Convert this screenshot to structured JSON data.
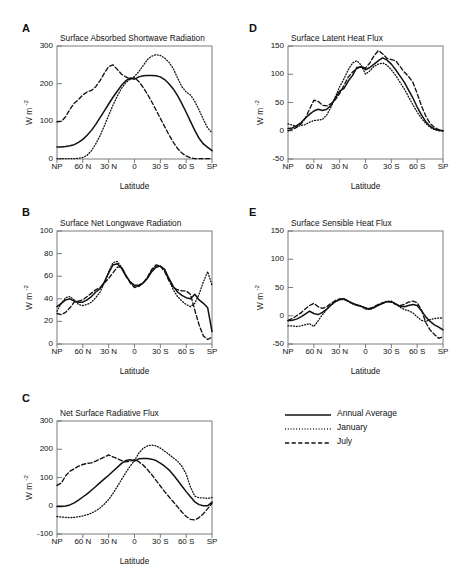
{
  "figure": {
    "width": 472,
    "height": 577,
    "background": "#ffffff",
    "line_color": "#111111"
  },
  "legend": {
    "entries": [
      {
        "label": "Annual Average",
        "style": "solid"
      },
      {
        "label": "January",
        "style": "dotted"
      },
      {
        "label": "July",
        "style": "dashed"
      }
    ]
  },
  "axis_common": {
    "xlabel": "Latitude",
    "ylabel": "W m",
    "ylabel_exponent": "-2",
    "xticks": [
      "NP",
      "60 N",
      "30 N",
      "0",
      "30 S",
      "60 S",
      "SP"
    ],
    "xlim": [
      90,
      -90
    ]
  },
  "chart_data": [
    {
      "panel": "A",
      "type": "line",
      "title": "Surface Absorbed Shortwave Radiation",
      "xlabel": "Latitude",
      "ylabel": "W m-2",
      "xticks": [
        "NP",
        "60 N",
        "30 N",
        "0",
        "30 S",
        "60 S",
        "SP"
      ],
      "xtickvals": [
        90,
        60,
        30,
        0,
        -30,
        -60,
        -90
      ],
      "yticks": [
        0,
        100,
        200,
        300
      ],
      "ylim": [
        0,
        300
      ],
      "xlim": [
        90,
        -90
      ],
      "x": [
        90,
        85,
        80,
        75,
        70,
        65,
        60,
        55,
        50,
        45,
        40,
        35,
        30,
        25,
        20,
        15,
        10,
        5,
        0,
        -5,
        -10,
        -15,
        -20,
        -25,
        -30,
        -35,
        -40,
        -45,
        -50,
        -55,
        -60,
        -65,
        -70,
        -75,
        -80,
        -85,
        -90
      ],
      "series": [
        {
          "name": "Annual Average",
          "style": "solid",
          "values": [
            32,
            32,
            33,
            35,
            38,
            44,
            52,
            63,
            76,
            92,
            110,
            128,
            146,
            164,
            180,
            196,
            208,
            215,
            212,
            218,
            221,
            222,
            222,
            221,
            218,
            211,
            200,
            186,
            168,
            147,
            124,
            100,
            76,
            55,
            40,
            31,
            22
          ]
        },
        {
          "name": "January",
          "style": "dotted",
          "values": [
            1,
            1,
            1,
            1,
            1,
            2,
            4,
            10,
            22,
            40,
            62,
            88,
            116,
            143,
            167,
            188,
            203,
            212,
            219,
            232,
            248,
            264,
            273,
            277,
            275,
            268,
            257,
            240,
            215,
            192,
            178,
            170,
            153,
            130,
            105,
            82,
            70
          ]
        },
        {
          "name": "July",
          "style": "dashed",
          "values": [
            99,
            100,
            112,
            132,
            148,
            158,
            170,
            178,
            182,
            192,
            208,
            228,
            245,
            250,
            238,
            225,
            218,
            212,
            216,
            206,
            190,
            172,
            152,
            130,
            108,
            86,
            64,
            45,
            28,
            16,
            8,
            3,
            1,
            1,
            1,
            1,
            1
          ]
        }
      ]
    },
    {
      "panel": "B",
      "type": "line",
      "title": "Surface Net Longwave Radiation",
      "xlabel": "Latitude",
      "ylabel": "W m-2",
      "xticks": [
        "NP",
        "60 N",
        "30 N",
        "0",
        "30 S",
        "60 S",
        "SP"
      ],
      "xtickvals": [
        90,
        60,
        30,
        0,
        -30,
        -60,
        -90
      ],
      "yticks": [
        0,
        20,
        40,
        60,
        80,
        100
      ],
      "ylim": [
        0,
        100
      ],
      "xlim": [
        90,
        -90
      ],
      "x": [
        90,
        85,
        80,
        75,
        70,
        65,
        60,
        55,
        50,
        45,
        40,
        35,
        30,
        25,
        20,
        15,
        10,
        5,
        0,
        -5,
        -10,
        -15,
        -20,
        -25,
        -30,
        -35,
        -40,
        -45,
        -50,
        -55,
        -60,
        -65,
        -70,
        -75,
        -80,
        -85,
        -90
      ],
      "series": [
        {
          "name": "Annual Average",
          "style": "solid",
          "values": [
            33,
            36,
            39,
            40,
            38,
            37,
            37,
            39,
            42,
            46,
            49,
            55,
            63,
            70,
            71,
            67,
            60,
            55,
            52,
            52,
            54,
            58,
            64,
            68,
            69,
            66,
            58,
            51,
            46,
            43,
            41,
            40,
            44,
            39,
            36,
            32,
            11
          ]
        },
        {
          "name": "January",
          "style": "dotted",
          "values": [
            29,
            36,
            41,
            42,
            39,
            35,
            34,
            35,
            37,
            41,
            46,
            54,
            64,
            72,
            73,
            68,
            61,
            55,
            51,
            51,
            54,
            59,
            65,
            69,
            69,
            65,
            57,
            48,
            42,
            38,
            35,
            33,
            36,
            44,
            55,
            64,
            52
          ]
        },
        {
          "name": "July",
          "style": "dashed",
          "values": [
            27,
            26,
            28,
            32,
            37,
            38,
            39,
            42,
            45,
            48,
            50,
            54,
            58,
            63,
            68,
            68,
            61,
            54,
            50,
            51,
            54,
            59,
            66,
            70,
            69,
            64,
            56,
            50,
            48,
            47,
            47,
            44,
            30,
            17,
            7,
            4,
            6
          ]
        }
      ]
    },
    {
      "panel": "C",
      "type": "line",
      "title": "Net Surface Radiative Flux",
      "xlabel": "Latitude",
      "ylabel": "W m-2",
      "xticks": [
        "NP",
        "60 N",
        "30 N",
        "0",
        "30 S",
        "60 S",
        "SP"
      ],
      "xtickvals": [
        90,
        60,
        30,
        0,
        -30,
        -60,
        -90
      ],
      "yticks": [
        -100,
        0,
        100,
        200,
        300
      ],
      "ylim": [
        -100,
        300
      ],
      "xlim": [
        90,
        -90
      ],
      "x": [
        90,
        85,
        80,
        75,
        70,
        65,
        60,
        55,
        50,
        45,
        40,
        35,
        30,
        25,
        20,
        15,
        10,
        5,
        0,
        -5,
        -10,
        -15,
        -20,
        -25,
        -30,
        -35,
        -40,
        -45,
        -50,
        -55,
        -60,
        -65,
        -70,
        -75,
        -80,
        -85,
        -90
      ],
      "series": [
        {
          "name": "Annual Average",
          "style": "solid",
          "values": [
            -3,
            -3,
            -1,
            3,
            10,
            20,
            31,
            42,
            55,
            68,
            82,
            95,
            108,
            122,
            136,
            150,
            160,
            163,
            158,
            166,
            167,
            167,
            165,
            160,
            151,
            140,
            127,
            110,
            90,
            70,
            50,
            32,
            14,
            4,
            0,
            0,
            13
          ]
        },
        {
          "name": "January",
          "style": "dotted",
          "values": [
            -38,
            -40,
            -41,
            -42,
            -41,
            -39,
            -36,
            -32,
            -26,
            -18,
            -8,
            6,
            22,
            43,
            68,
            93,
            118,
            140,
            160,
            186,
            203,
            212,
            215,
            212,
            204,
            193,
            182,
            170,
            158,
            140,
            112,
            66,
            34,
            28,
            28,
            26,
            29
          ]
        },
        {
          "name": "July",
          "style": "dashed",
          "values": [
            72,
            80,
            106,
            122,
            131,
            140,
            146,
            150,
            152,
            158,
            165,
            172,
            180,
            173,
            167,
            160,
            155,
            158,
            163,
            156,
            144,
            128,
            110,
            90,
            70,
            50,
            32,
            14,
            -4,
            -22,
            -38,
            -48,
            -50,
            -42,
            -28,
            -10,
            9
          ]
        }
      ]
    },
    {
      "panel": "D",
      "type": "line",
      "title": "Surface Latent Heat Flux",
      "xlabel": "Latitude",
      "ylabel": "W m-2",
      "xticks": [
        "NP",
        "60 N",
        "30 N",
        "0",
        "30 S",
        "60 S",
        "SP"
      ],
      "xtickvals": [
        90,
        60,
        30,
        0,
        -30,
        -60,
        -90
      ],
      "yticks": [
        -50,
        0,
        50,
        100,
        150
      ],
      "ylim": [
        -50,
        150
      ],
      "xlim": [
        90,
        -90
      ],
      "x": [
        90,
        85,
        80,
        75,
        70,
        65,
        60,
        55,
        50,
        45,
        40,
        35,
        30,
        25,
        20,
        15,
        10,
        5,
        0,
        -5,
        -10,
        -15,
        -20,
        -25,
        -30,
        -35,
        -40,
        -45,
        -50,
        -55,
        -60,
        -65,
        -70,
        -75,
        -80,
        -85,
        -90
      ],
      "series": [
        {
          "name": "Annual Average",
          "style": "solid",
          "values": [
            4,
            5,
            9,
            14,
            22,
            29,
            35,
            38,
            36,
            38,
            45,
            58,
            70,
            75,
            88,
            98,
            112,
            113,
            108,
            112,
            118,
            124,
            129,
            125,
            118,
            108,
            97,
            86,
            72,
            58,
            42,
            28,
            16,
            8,
            3,
            1,
            0
          ]
        },
        {
          "name": "January",
          "style": "dotted",
          "values": [
            12,
            10,
            8,
            9,
            11,
            15,
            18,
            19,
            20,
            28,
            42,
            60,
            78,
            92,
            108,
            120,
            124,
            116,
            100,
            106,
            114,
            118,
            120,
            116,
            108,
            98,
            86,
            74,
            60,
            46,
            33,
            22,
            13,
            6,
            2,
            0,
            0
          ]
        },
        {
          "name": "July",
          "style": "dashed",
          "values": [
            0,
            2,
            6,
            12,
            22,
            38,
            54,
            52,
            45,
            44,
            48,
            55,
            66,
            80,
            95,
            104,
            110,
            114,
            111,
            120,
            133,
            142,
            136,
            128,
            126,
            124,
            114,
            104,
            96,
            86,
            66,
            44,
            26,
            13,
            6,
            2,
            0
          ]
        }
      ]
    },
    {
      "panel": "E",
      "type": "line",
      "title": "Surface Sensible Heat Flux",
      "xlabel": "Latitude",
      "ylabel": "W m-2",
      "xticks": [
        "NP",
        "60 N",
        "30 N",
        "0",
        "30 S",
        "60 S",
        "SP"
      ],
      "xtickvals": [
        90,
        60,
        30,
        0,
        -30,
        -60,
        -90
      ],
      "yticks": [
        -50,
        0,
        50,
        100,
        150
      ],
      "ylim": [
        -50,
        150
      ],
      "xlim": [
        90,
        -90
      ],
      "x": [
        90,
        85,
        80,
        75,
        70,
        65,
        60,
        55,
        50,
        45,
        40,
        35,
        30,
        25,
        20,
        15,
        10,
        5,
        0,
        -5,
        -10,
        -15,
        -20,
        -25,
        -30,
        -35,
        -40,
        -45,
        -50,
        -55,
        -60,
        -65,
        -70,
        -75,
        -80,
        -85,
        -90
      ],
      "series": [
        {
          "name": "Annual Average",
          "style": "solid",
          "values": [
            -9,
            -8,
            -6,
            -2,
            3,
            8,
            4,
            2,
            6,
            12,
            19,
            25,
            29,
            30,
            26,
            22,
            19,
            17,
            13,
            12,
            15,
            19,
            22,
            25,
            25,
            21,
            17,
            16,
            18,
            20,
            18,
            9,
            -2,
            -10,
            -16,
            -20,
            -25
          ]
        },
        {
          "name": "January",
          "style": "dotted",
          "values": [
            -18,
            -18,
            -19,
            -18,
            -16,
            -14,
            -19,
            -9,
            2,
            11,
            19,
            25,
            28,
            29,
            25,
            21,
            18,
            16,
            12,
            11,
            14,
            18,
            22,
            26,
            26,
            21,
            15,
            11,
            9,
            5,
            -2,
            -8,
            -10,
            -7,
            -5,
            -4,
            -4
          ]
        },
        {
          "name": "July",
          "style": "dashed",
          "values": [
            -8,
            -5,
            0,
            5,
            12,
            18,
            22,
            16,
            13,
            16,
            22,
            27,
            30,
            30,
            26,
            22,
            19,
            17,
            14,
            13,
            16,
            20,
            23,
            25,
            24,
            20,
            18,
            20,
            24,
            26,
            23,
            10,
            -12,
            -25,
            -33,
            -40,
            -37
          ]
        }
      ]
    }
  ]
}
